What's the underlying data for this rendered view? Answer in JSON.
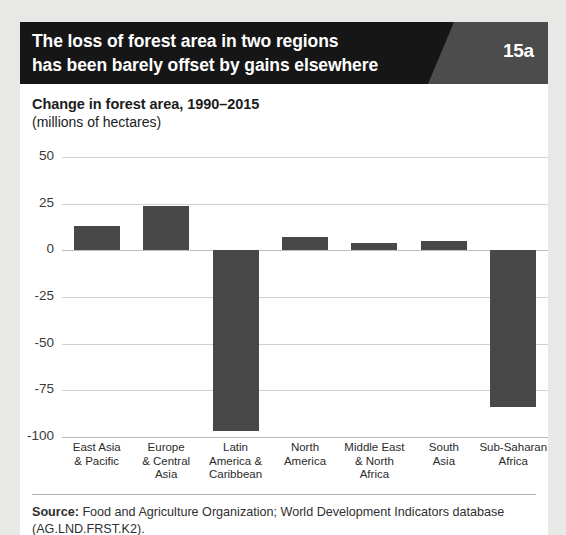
{
  "figure": {
    "number_label": "15a",
    "title_lines": [
      "The loss of forest area in two regions",
      "has been barely offset by gains elsewhere"
    ],
    "source_prefix": "Source:",
    "source_text": " Food and Agriculture Organization; World Development Indicators database (AG.LND.FRST.K2)."
  },
  "colors": {
    "banner": "#161616",
    "badge_panel": "#4c4c4c",
    "bar": "#484848",
    "gridline": "#d2d2d2",
    "page_background": "#e8e8e6",
    "card_background": "#ffffff"
  },
  "chart_data": {
    "type": "bar",
    "title": "Change in forest area, 1990–2015",
    "subtitle": "(millions of hectares)",
    "xlabel": "",
    "ylabel": "",
    "ylim": [
      -100,
      50
    ],
    "yticks": [
      50,
      25,
      0,
      -25,
      -50,
      -75,
      -100
    ],
    "ytick_labels": [
      "50",
      "25",
      "0",
      "-25",
      "-50",
      "-75",
      "-100"
    ],
    "grid": true,
    "legend": false,
    "orientation": "vertical",
    "categories": [
      "East Asia\n& Pacific",
      "Europe\n& Central\nAsia",
      "Latin\nAmerica &\nCaribbean",
      "North\nAmerica",
      "Middle East\n& North\nAfrica",
      "South\nAsia",
      "Sub-Saharan\nAfrica"
    ],
    "category_lines": [
      [
        "East Asia",
        "& Pacific"
      ],
      [
        "Europe",
        "& Central",
        "Asia"
      ],
      [
        "Latin",
        "America &",
        "Caribbean"
      ],
      [
        "North",
        "America"
      ],
      [
        "Middle East",
        "& North",
        "Africa"
      ],
      [
        "South",
        "Asia"
      ],
      [
        "Sub-Saharan",
        "Africa"
      ]
    ],
    "values": [
      13,
      24,
      -97,
      7,
      4,
      5,
      -84
    ],
    "series": [
      {
        "name": "Change in forest area, 1990-2015 (millions of hectares)",
        "values": [
          13,
          24,
          -97,
          7,
          4,
          5,
          -84
        ]
      }
    ]
  }
}
